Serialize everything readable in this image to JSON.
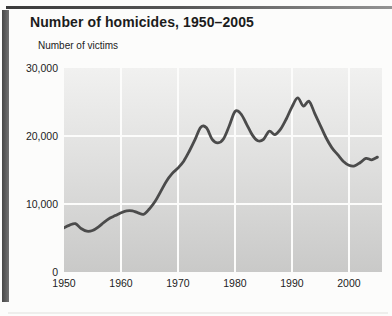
{
  "figure": {
    "title": "Number of homicides, 1950–2005",
    "y_axis_title": "Number of victims"
  },
  "colors": {
    "line": "#4b4b4b",
    "plot_bg_top": "#f1f1f0",
    "plot_bg_bottom": "#c9c9c8",
    "gridline": "#fcfcfb",
    "accent_bar": "#5a5a5a",
    "top_rule": "#3a3a3a",
    "text": "#1d1d1d"
  },
  "y_axis": {
    "ticks": [
      {
        "label": "30,000",
        "value": 30000
      },
      {
        "label": "20,000",
        "value": 20000
      },
      {
        "label": "10,000",
        "value": 10000
      },
      {
        "label": "0",
        "value": 0
      }
    ]
  },
  "x_axis": {
    "ticks": [
      {
        "label": "1950",
        "value": 1950
      },
      {
        "label": "1960",
        "value": 1960
      },
      {
        "label": "1970",
        "value": 1970
      },
      {
        "label": "1980",
        "value": 1980
      },
      {
        "label": "1990",
        "value": 1990
      },
      {
        "label": "2000",
        "value": 2000
      }
    ]
  },
  "chart_data": {
    "type": "line",
    "title": "Number of homicides, 1950–2005",
    "xlabel": "",
    "ylabel": "Number of victims",
    "ylim": [
      0,
      30000
    ],
    "xlim": [
      1950,
      2005.8
    ],
    "grid": true,
    "legend": false,
    "line_color": "#4b4b4b",
    "x": [
      1950,
      1951,
      1952,
      1953,
      1954,
      1955,
      1956,
      1957,
      1958,
      1959,
      1960,
      1961,
      1962,
      1963,
      1964,
      1965,
      1966,
      1967,
      1968,
      1969,
      1970,
      1971,
      1972,
      1973,
      1974,
      1975,
      1976,
      1977,
      1978,
      1979,
      1980,
      1981,
      1982,
      1983,
      1984,
      1985,
      1986,
      1987,
      1988,
      1989,
      1990,
      1991,
      1992,
      1993,
      1994,
      1995,
      1996,
      1997,
      1998,
      1999,
      2000,
      2001,
      2002,
      2003,
      2004,
      2005
    ],
    "values": [
      6500,
      6900,
      7100,
      6400,
      6000,
      6100,
      6600,
      7300,
      7900,
      8300,
      8700,
      9000,
      9000,
      8700,
      8500,
      9300,
      10400,
      11900,
      13400,
      14500,
      15300,
      16300,
      17800,
      19500,
      21300,
      21200,
      19500,
      19000,
      19600,
      21500,
      23600,
      23300,
      21800,
      20200,
      19300,
      19500,
      20700,
      20200,
      21000,
      22500,
      24300,
      25600,
      24400,
      25100,
      23300,
      21500,
      19700,
      18300,
      17300,
      16300,
      15700,
      15600,
      16100,
      16700,
      16500,
      16900
    ]
  }
}
